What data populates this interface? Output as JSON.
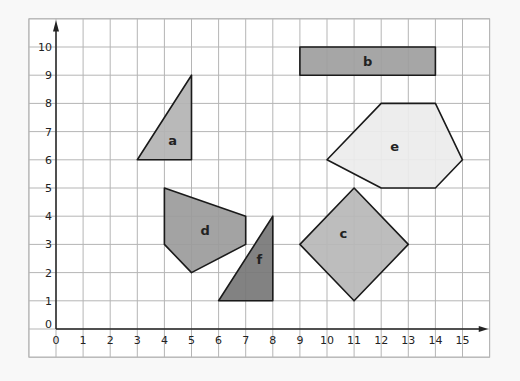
{
  "diagram": {
    "type": "coordinate-grid",
    "x_axis": {
      "min": 0,
      "max": 15,
      "ticks": [
        "0",
        "1",
        "2",
        "3",
        "4",
        "5",
        "6",
        "7",
        "8",
        "9",
        "10",
        "11",
        "12",
        "13",
        "14",
        "15"
      ]
    },
    "y_axis": {
      "min": 0,
      "max": 10,
      "ticks": [
        "0",
        "1",
        "2",
        "3",
        "4",
        "5",
        "6",
        "7",
        "8",
        "9",
        "10"
      ]
    },
    "colors": {
      "background": "#f8f8f8",
      "grid_fill": "#ffffff",
      "grid_line": "#b5b5b5",
      "axis": "#222222",
      "outline": "#1a1a1a"
    },
    "shapes": [
      {
        "id": "a",
        "label": "a",
        "kind": "triangle",
        "fill": "#b3b3b3",
        "points": [
          [
            3,
            6
          ],
          [
            5,
            9
          ],
          [
            5,
            6
          ]
        ],
        "label_pos": [
          4.3,
          6.7
        ]
      },
      {
        "id": "b",
        "label": "b",
        "kind": "rectangle",
        "fill": "#9e9e9e",
        "points": [
          [
            9,
            9
          ],
          [
            14,
            9
          ],
          [
            14,
            10
          ],
          [
            9,
            10
          ]
        ],
        "label_pos": [
          11.5,
          9.5
        ]
      },
      {
        "id": "c",
        "label": "c",
        "kind": "square",
        "fill": "#b7b7b7",
        "points": [
          [
            9,
            3
          ],
          [
            11,
            5
          ],
          [
            13,
            3
          ],
          [
            11,
            1
          ]
        ],
        "label_pos": [
          10.6,
          3.4
        ]
      },
      {
        "id": "d",
        "label": "d",
        "kind": "pentagon",
        "fill": "#9b9b9b",
        "points": [
          [
            4,
            5
          ],
          [
            7,
            4
          ],
          [
            7,
            3
          ],
          [
            5,
            2
          ],
          [
            4,
            3
          ]
        ],
        "label_pos": [
          5.5,
          3.5
        ]
      },
      {
        "id": "e",
        "label": "e",
        "kind": "hexagon",
        "fill": "#ececec",
        "points": [
          [
            10,
            6
          ],
          [
            12,
            8
          ],
          [
            14,
            8
          ],
          [
            15,
            6
          ],
          [
            14,
            5
          ],
          [
            12,
            5
          ]
        ],
        "label_pos": [
          12.5,
          6.5
        ]
      },
      {
        "id": "f",
        "label": "f",
        "kind": "triangle",
        "fill": "#777777",
        "points": [
          [
            6,
            1
          ],
          [
            8,
            4
          ],
          [
            8,
            1
          ]
        ],
        "label_pos": [
          7.5,
          2.5
        ]
      }
    ]
  }
}
